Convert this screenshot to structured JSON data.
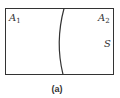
{
  "diagram": {
    "universal_set": {
      "label": "S"
    },
    "regions": [
      {
        "label": "A",
        "subscript": "1"
      },
      {
        "label": "A",
        "subscript": "2"
      }
    ],
    "caption": "(a)",
    "colors": {
      "stroke": "#333333",
      "background": "#ffffff"
    }
  }
}
